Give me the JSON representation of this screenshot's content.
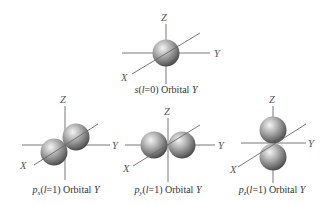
{
  "diagram": {
    "axes_labels": {
      "x": "X",
      "y": "Y",
      "z": "Z"
    },
    "colors": {
      "axis": "#6a6a6a",
      "sphere_light": "#f2f2f2",
      "sphere_mid": "#9a9a9a",
      "sphere_dark": "#3e3e3e"
    },
    "orbitals": [
      {
        "id": "s",
        "letter": "s",
        "subscript": "",
        "quantum": "l",
        "eq": "=0",
        "suffix": "Orbital",
        "func": "Y",
        "lobes": 1
      },
      {
        "id": "px",
        "letter": "p",
        "subscript": "x",
        "quantum": "l",
        "eq": "=1",
        "suffix": "Orbital",
        "func": "Y",
        "lobes": 2,
        "orientation": "x"
      },
      {
        "id": "py",
        "letter": "p",
        "subscript": "y",
        "quantum": "l",
        "eq": "=1",
        "suffix": "Orbital",
        "func": "Y",
        "lobes": 2,
        "orientation": "y"
      },
      {
        "id": "pz",
        "letter": "p",
        "subscript": "z",
        "quantum": "l",
        "eq": "=1",
        "suffix": "Orbital",
        "func": "Y",
        "lobes": 2,
        "orientation": "z"
      }
    ]
  }
}
